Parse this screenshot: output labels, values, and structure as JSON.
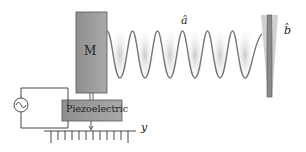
{
  "diagram": {
    "mass_label": "M",
    "piezo_label": "Piezoelectric",
    "axis_label": "y",
    "mode_a_label": "â",
    "mode_b_label": "b̂",
    "source_symbol": "~"
  },
  "colors": {
    "box_fill": "#9a9a9a",
    "box_stroke": "#555555",
    "wave": "#777777",
    "glow": "#cfcfcf",
    "mirror": "#8a8a8a",
    "mirror_ghost": "#c8c8c8",
    "line": "#333333"
  }
}
